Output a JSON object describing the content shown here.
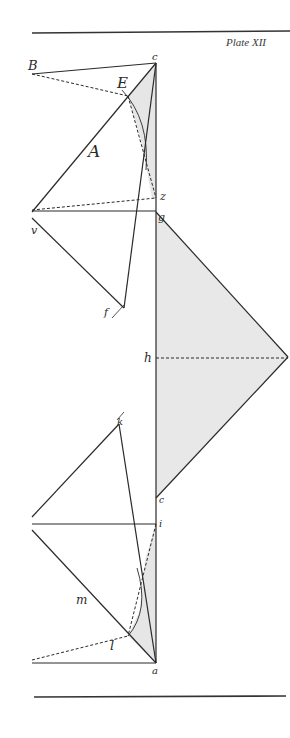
{
  "plate": {
    "title": "Plate XII"
  },
  "colors": {
    "ink": "#2a2a2a",
    "shade": "#e6e6e6",
    "paper": "#ffffff"
  },
  "labels": {
    "B": "B",
    "c_top": "c",
    "E": "E",
    "A": "A",
    "z": "z",
    "g": "g",
    "v": "v",
    "f": "f",
    "h": "h",
    "k": "k",
    "c_mid": "c",
    "i": "i",
    "m": "m",
    "l": "l",
    "a": "a"
  }
}
